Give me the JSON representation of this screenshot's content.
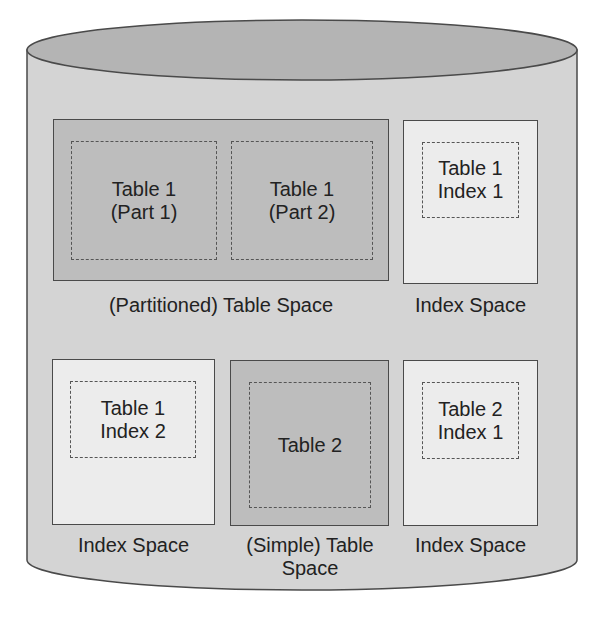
{
  "diagram": {
    "container": {
      "shape": "cylinder",
      "label": ""
    },
    "colors": {
      "cylinder_body": "#d4d4d4",
      "cylinder_top": "#b4b4b4",
      "dark_box": "#bdbdbd",
      "light_box": "#ececec",
      "stroke": "#4a4a4a"
    },
    "spaces": [
      {
        "id": "partitioned-table-space",
        "caption": "(Partitioned) Table Space",
        "items": [
          {
            "text": "Table 1\n(Part 1)"
          },
          {
            "text": "Table 1\n(Part 2)"
          }
        ]
      },
      {
        "id": "index-space-1",
        "caption": "Index Space",
        "items": [
          {
            "text": "Table 1\nIndex 1"
          }
        ]
      },
      {
        "id": "index-space-2",
        "caption": "Index Space",
        "items": [
          {
            "text": "Table 1\nIndex 2"
          }
        ]
      },
      {
        "id": "simple-table-space",
        "caption": "(Simple) Table\nSpace",
        "items": [
          {
            "text": "Table 2"
          }
        ]
      },
      {
        "id": "index-space-3",
        "caption": "Index Space",
        "items": [
          {
            "text": "Table 2\nIndex 1"
          }
        ]
      }
    ]
  }
}
